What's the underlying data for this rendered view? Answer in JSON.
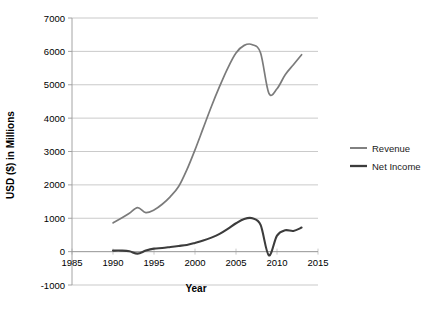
{
  "chart_data": {
    "type": "line",
    "title": "",
    "xlabel": "Year",
    "ylabel": "USD ($) in Millions",
    "xlim": [
      1985,
      2015
    ],
    "ylim": [
      -1000,
      7000
    ],
    "xticks": [
      1985,
      1990,
      1995,
      2000,
      2005,
      2010,
      2015
    ],
    "yticks": [
      -1000,
      0,
      1000,
      2000,
      3000,
      4000,
      5000,
      6000,
      7000
    ],
    "grid": true,
    "legend_position": "right",
    "x": [
      1990,
      1991,
      1992,
      1993,
      1994,
      1995,
      1996,
      1997,
      1998,
      1999,
      2000,
      2001,
      2002,
      2003,
      2004,
      2005,
      2006,
      2007,
      2008,
      2009,
      2010,
      2011,
      2012,
      2013
    ],
    "series": [
      {
        "name": "Revenue",
        "color": "#7b7b7b",
        "values": [
          860,
          1000,
          1150,
          1320,
          1170,
          1250,
          1420,
          1650,
          1950,
          2450,
          3050,
          3700,
          4350,
          4950,
          5500,
          5950,
          6180,
          6200,
          5950,
          4750,
          4880,
          5300,
          5600,
          5900
        ]
      },
      {
        "name": "Net Income",
        "color": "#3c3c3c",
        "values": [
          30,
          30,
          10,
          -60,
          30,
          90,
          110,
          140,
          170,
          200,
          260,
          330,
          420,
          530,
          680,
          850,
          980,
          1000,
          800,
          -110,
          480,
          640,
          620,
          720
        ]
      }
    ]
  },
  "legend": {
    "items": [
      {
        "label": "Revenue",
        "color": "#7b7b7b"
      },
      {
        "label": "Net Income",
        "color": "#3c3c3c"
      }
    ]
  },
  "axes": {
    "x_title": "Year",
    "y_title": "USD ($) in Millions",
    "x_tick_labels": [
      "1985",
      "1990",
      "1995",
      "2000",
      "2005",
      "2010",
      "2015"
    ],
    "y_tick_labels": [
      "7000",
      "6000",
      "5000",
      "4000",
      "3000",
      "2000",
      "1000",
      "0",
      "-1000"
    ]
  },
  "colors": {
    "background": "#ffffff",
    "gridline": "#b3b3b3",
    "axis": "#9a9a9a",
    "text": "#000000"
  }
}
